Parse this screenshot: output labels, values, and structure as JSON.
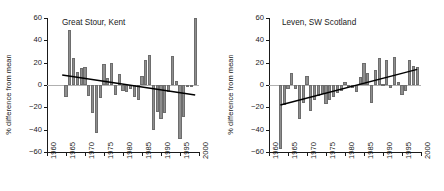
{
  "figure": {
    "ylabel": "% difference from mean",
    "bar_color": "#8e8e8e",
    "bar_edge_color": "#6d6d6d",
    "trend_color": "#000000",
    "zero_line_color": "#b0b0b0"
  },
  "chart_data": [
    {
      "type": "bar",
      "title": "Great Stour, Kent",
      "xlabel": "",
      "ylabel": "% difference from mean",
      "ylim": [
        -60,
        60
      ],
      "xlim": [
        1960,
        2000
      ],
      "yticks": [
        60,
        40,
        20,
        0,
        -20,
        -40,
        -60
      ],
      "xticks": [
        1960,
        1965,
        1970,
        1975,
        1980,
        1985,
        1990,
        1995,
        2000
      ],
      "grid": false,
      "legend": "none",
      "annotations": [
        "linear trend line, negative slope"
      ],
      "trend": {
        "x": [
          1964,
          1999
        ],
        "y": [
          9,
          -9
        ]
      },
      "x": [
        1965,
        1966,
        1967,
        1968,
        1969,
        1970,
        1971,
        1972,
        1973,
        1974,
        1975,
        1976,
        1977,
        1978,
        1979,
        1980,
        1981,
        1982,
        1983,
        1984,
        1985,
        1986,
        1987,
        1988,
        1989,
        1990,
        1991,
        1992,
        1993,
        1994,
        1995,
        1996,
        1997,
        1998,
        1999
      ],
      "values": [
        -11,
        49,
        24,
        12,
        15,
        16,
        -10,
        -25,
        -43,
        -12,
        19,
        6,
        20,
        -9,
        10,
        -5,
        -6,
        -4,
        -11,
        -13,
        8,
        22,
        27,
        -40,
        -24,
        -30,
        -25,
        -6,
        26,
        4,
        -48,
        -29,
        -2,
        -2,
        60
      ]
    },
    {
      "type": "bar",
      "title": "Leven, SW Scotland",
      "xlabel": "",
      "ylabel": "% difference from mean",
      "ylim": [
        -60,
        60
      ],
      "xlim": [
        1960,
        2000
      ],
      "yticks": [
        60,
        40,
        20,
        0,
        -20,
        -40,
        -60
      ],
      "xticks": [
        1960,
        1965,
        1970,
        1975,
        1980,
        1985,
        1990,
        1995,
        2000
      ],
      "grid": false,
      "legend": "none",
      "annotations": [
        "linear trend line, positive slope"
      ],
      "trend": {
        "x": [
          1963,
          1999
        ],
        "y": [
          -18,
          14
        ]
      },
      "x": [
        1963,
        1964,
        1965,
        1966,
        1967,
        1968,
        1969,
        1970,
        1971,
        1972,
        1973,
        1974,
        1975,
        1976,
        1977,
        1978,
        1979,
        1980,
        1981,
        1982,
        1983,
        1984,
        1985,
        1986,
        1987,
        1988,
        1989,
        1990,
        1991,
        1992,
        1993,
        1994,
        1995,
        1996,
        1997,
        1998,
        1999
      ],
      "values": [
        -57,
        -18,
        -4,
        11,
        -4,
        -30,
        -16,
        8,
        -23,
        -13,
        -10,
        -8,
        -17,
        -13,
        -11,
        -7,
        -5,
        3,
        -2,
        -3,
        -6,
        7,
        20,
        11,
        -16,
        13,
        24,
        1,
        22,
        -3,
        25,
        3,
        -9,
        -5,
        22,
        17,
        16
      ]
    }
  ]
}
